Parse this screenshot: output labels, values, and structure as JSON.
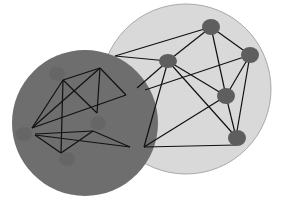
{
  "diagram": {
    "clusters": [
      {
        "id": "light",
        "label": "",
        "color": "#d9d9d9",
        "node_color": "#5e5e5e"
      },
      {
        "id": "dark",
        "label": "",
        "color": "#6e6e6e",
        "node_color": "#656565"
      }
    ],
    "nodes": [
      {
        "id": "L1",
        "cluster": "light"
      },
      {
        "id": "L2",
        "cluster": "light"
      },
      {
        "id": "L3",
        "cluster": "light"
      },
      {
        "id": "L4",
        "cluster": "light"
      },
      {
        "id": "L5",
        "cluster": "light"
      },
      {
        "id": "D1",
        "cluster": "dark"
      },
      {
        "id": "D2",
        "cluster": "dark"
      },
      {
        "id": "D3",
        "cluster": "dark"
      },
      {
        "id": "D4",
        "cluster": "dark"
      }
    ],
    "edge_color": "#111111",
    "edge_count": 26
  }
}
